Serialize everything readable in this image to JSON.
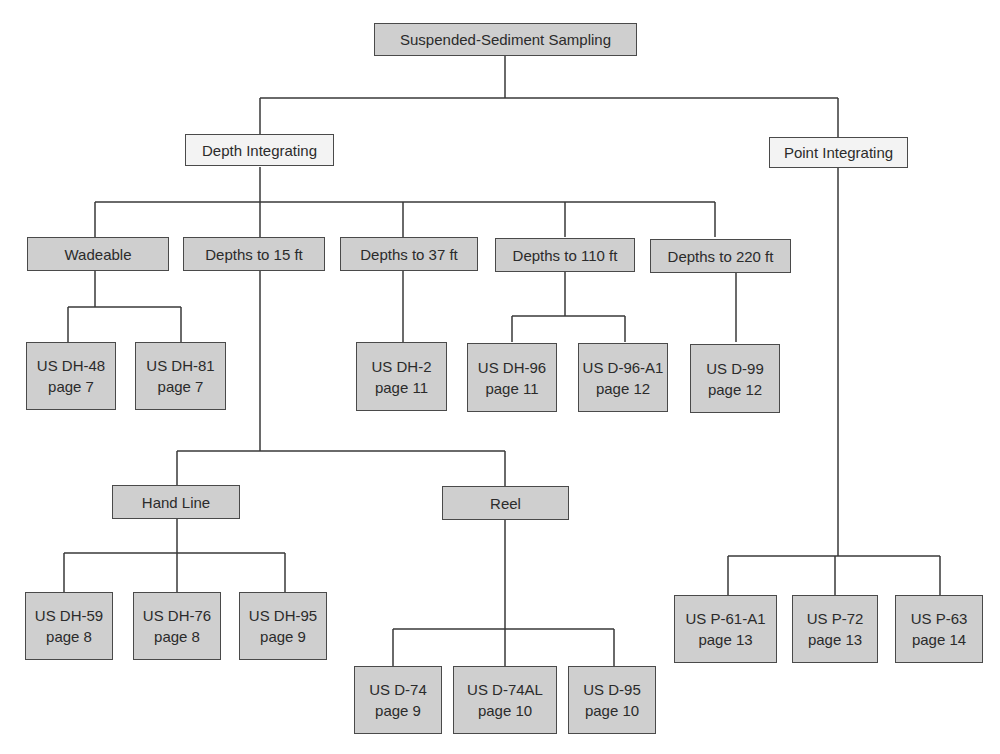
{
  "diagram": {
    "type": "tree",
    "colors": {
      "category_fill": "#cfcfcf",
      "method_fill": "#f3f3f3",
      "line": "#3a3a3a"
    },
    "root": {
      "label": "Suspended-Sediment Sampling"
    },
    "methods": {
      "depth_integrating": {
        "label": "Depth Integrating"
      },
      "point_integrating": {
        "label": "Point Integrating"
      }
    },
    "depth_categories": [
      {
        "label": "Wadeable"
      },
      {
        "label": "Depths to 15 ft"
      },
      {
        "label": "Depths to 37 ft"
      },
      {
        "label": "Depths to 110 ft"
      },
      {
        "label": "Depths to 220 ft"
      }
    ],
    "suspension": [
      {
        "label": "Hand Line"
      },
      {
        "label": "Reel"
      }
    ],
    "samplers": {
      "wadeable": [
        {
          "name": "US DH-48",
          "page": "page 7"
        },
        {
          "name": "US DH-81",
          "page": "page 7"
        }
      ],
      "depth37": [
        {
          "name": "US DH-2",
          "page": "page 11"
        }
      ],
      "depth110": [
        {
          "name": "US DH-96",
          "page": "page 11"
        },
        {
          "name": "US D-96-A1",
          "page": "page 12"
        }
      ],
      "depth220": [
        {
          "name": "US D-99",
          "page": "page 12"
        }
      ],
      "hand_line": [
        {
          "name": "US DH-59",
          "page": "page 8"
        },
        {
          "name": "US DH-76",
          "page": "page 8"
        },
        {
          "name": "US DH-95",
          "page": "page 9"
        }
      ],
      "reel": [
        {
          "name": "US D-74",
          "page": "page 9"
        },
        {
          "name": "US D-74AL",
          "page": "page 10"
        },
        {
          "name": "US D-95",
          "page": "page 10"
        }
      ],
      "point": [
        {
          "name": "US P-61-A1",
          "page": "page 13"
        },
        {
          "name": "US P-72",
          "page": "page 13"
        },
        {
          "name": "US P-63",
          "page": "page 14"
        }
      ]
    }
  }
}
